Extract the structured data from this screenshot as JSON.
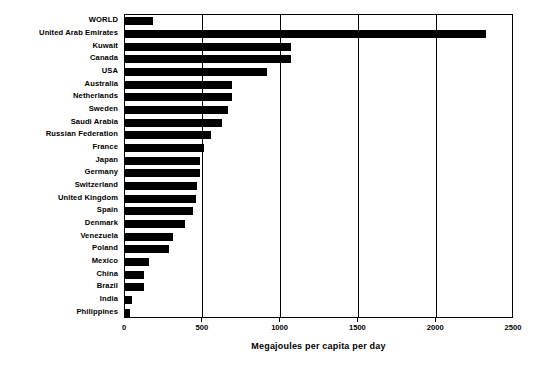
{
  "chart_data": {
    "type": "bar",
    "orientation": "horizontal",
    "title": "",
    "xlabel": "Megajoules per capita per day",
    "ylabel": "",
    "xlim": [
      0,
      2500
    ],
    "xticks": [
      0,
      500,
      1000,
      1500,
      2000,
      2500
    ],
    "xtick_labels": [
      "0",
      "500",
      "1000",
      "1500",
      "2000",
      "2500"
    ],
    "grid": true,
    "grid_axis": "x",
    "legend": false,
    "bar_color": "#000000",
    "categories": [
      "WORLD",
      "United Arab Emirates",
      "Kuwait",
      "Canada",
      "USA",
      "Australia",
      "Netherlands",
      "Sweden",
      "Saudi Arabia",
      "Russian Federation",
      "France",
      "Japan",
      "Germany",
      "Switzerland",
      "United Kingdom",
      "Spain",
      "Denmark",
      "Venezuela",
      "Poland",
      "Mexico",
      "China",
      "Brazil",
      "India",
      "Philippines"
    ],
    "values": [
      180,
      2320,
      1070,
      1070,
      910,
      690,
      685,
      665,
      625,
      555,
      510,
      480,
      480,
      465,
      455,
      440,
      385,
      310,
      285,
      155,
      125,
      125,
      45,
      35
    ]
  }
}
